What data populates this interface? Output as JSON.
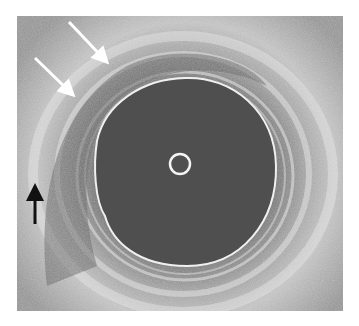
{
  "image": {
    "type": "ultrasound",
    "description": "Grayscale cross-sectional ultrasound with central catheter, dark circular lumen and layered wall",
    "colors": {
      "background": "#ffffff",
      "tissue": "#8e8e8e",
      "tissue_bright": "#d8d8d8",
      "lumen": "#4e4e4e",
      "echo_line": "#f2f2f2",
      "arrow_white": "#ffffff",
      "arrow_black": "#111111"
    }
  },
  "annotations": {
    "arrows": [
      {
        "name": "white-arrow-upper",
        "color": "white",
        "direction": "down-right"
      },
      {
        "name": "white-arrow-lower",
        "color": "white",
        "direction": "down-right"
      },
      {
        "name": "black-arrow",
        "color": "black",
        "direction": "up"
      }
    ]
  }
}
